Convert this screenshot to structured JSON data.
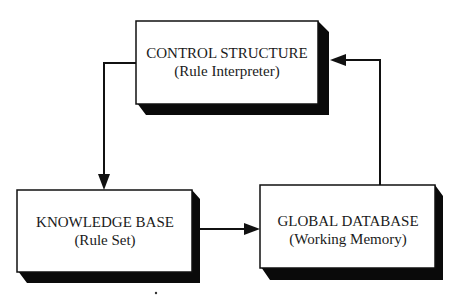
{
  "diagram": {
    "type": "block-diagram",
    "nodes": [
      {
        "id": "control",
        "title": "CONTROL STRUCTURE",
        "subtitle": "(Rule Interpreter)"
      },
      {
        "id": "knowledge",
        "title": "KNOWLEDGE BASE",
        "subtitle": "(Rule Set)"
      },
      {
        "id": "global",
        "title": "GLOBAL DATABASE",
        "subtitle": "(Working Memory)"
      }
    ],
    "edges": [
      {
        "from": "control",
        "to": "knowledge"
      },
      {
        "from": "knowledge",
        "to": "global"
      },
      {
        "from": "global",
        "to": "control"
      }
    ],
    "colors": {
      "stroke": "#111111",
      "shadow": "#0a0a0a",
      "fill": "#ffffff"
    }
  }
}
